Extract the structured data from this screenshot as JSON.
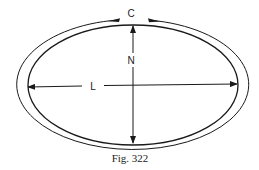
{
  "figure": {
    "caption": "Fig. 322",
    "labels": {
      "circumference": "C",
      "normal": "N",
      "length": "L"
    },
    "colors": {
      "ink": "#1a1a1a",
      "background": "#ffffff"
    }
  }
}
